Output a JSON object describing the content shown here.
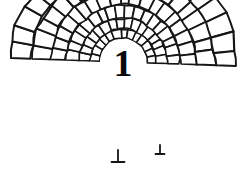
{
  "figure": {
    "center_label": "1",
    "label_font_size": 38,
    "background_color": "#ffffff",
    "stroke_color": "#161616",
    "label_color": "#0a0a0a",
    "cell_fill_color": "#ffffff",
    "canvas": {
      "width": 246,
      "height": 171
    },
    "origin": {
      "x": 123,
      "y": 62
    },
    "core_radius": 24,
    "angle_span": {
      "start_deg": -178,
      "end_deg": 2
    },
    "rings": [
      {
        "index": 1,
        "inner_radius": 24,
        "outer_radius": 33,
        "cells": 13,
        "jitter": 0.7,
        "stroke_width": 1.5
      },
      {
        "index": 2,
        "inner_radius": 33,
        "outer_radius": 44,
        "cells": 16,
        "jitter": 0.9,
        "stroke_width": 1.6
      },
      {
        "index": 3,
        "inner_radius": 44,
        "outer_radius": 57,
        "cells": 18,
        "jitter": 1.1,
        "stroke_width": 1.7
      },
      {
        "index": 4,
        "inner_radius": 57,
        "outer_radius": 73,
        "cells": 19,
        "jitter": 1.3,
        "stroke_width": 1.8
      },
      {
        "index": 5,
        "inner_radius": 73,
        "outer_radius": 92,
        "cells": 20,
        "jitter": 1.5,
        "stroke_width": 1.9
      },
      {
        "index": 6,
        "inner_radius": 92,
        "outer_radius": 113,
        "cells": 20,
        "jitter": 1.7,
        "stroke_width": 2.0
      }
    ],
    "stalks": [
      {
        "x": 118,
        "y": 150,
        "height": 12,
        "foot_width": 13
      },
      {
        "x": 160,
        "y": 145,
        "height": 9,
        "foot_width": 9
      }
    ]
  }
}
